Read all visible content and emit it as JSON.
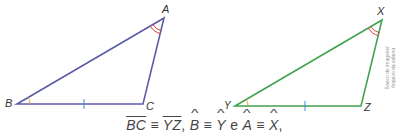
{
  "triangle1": {
    "color": "#5b5ba8",
    "vertices": {
      "A": {
        "label": "A",
        "x": 164,
        "y": 18
      },
      "B": {
        "label": "B",
        "x": 17,
        "y": 104
      },
      "C": {
        "label": "C",
        "x": 143,
        "y": 104
      }
    }
  },
  "triangle2": {
    "color": "#3fa34d",
    "vertices": {
      "X": {
        "label": "X",
        "x": 382,
        "y": 20
      },
      "Y": {
        "label": "Y",
        "x": 235,
        "y": 106
      },
      "Z": {
        "label": "Z",
        "x": 361,
        "y": 106
      }
    }
  },
  "marks": {
    "single_arc_color": "#e8a03a",
    "double_arc_color": "#d9403a",
    "tick_color": "#3a8fd6"
  },
  "credit": {
    "line1": "Banco de imagens/",
    "line2": "Arquivo da editora"
  },
  "caption": {
    "seg1": "BC",
    "seg2": "YZ",
    "ang1": "B",
    "ang2": "Y",
    "ang3": "A",
    "ang4": "X",
    "cong": "≡",
    "comma": ",",
    "e": "e",
    "end": ","
  }
}
